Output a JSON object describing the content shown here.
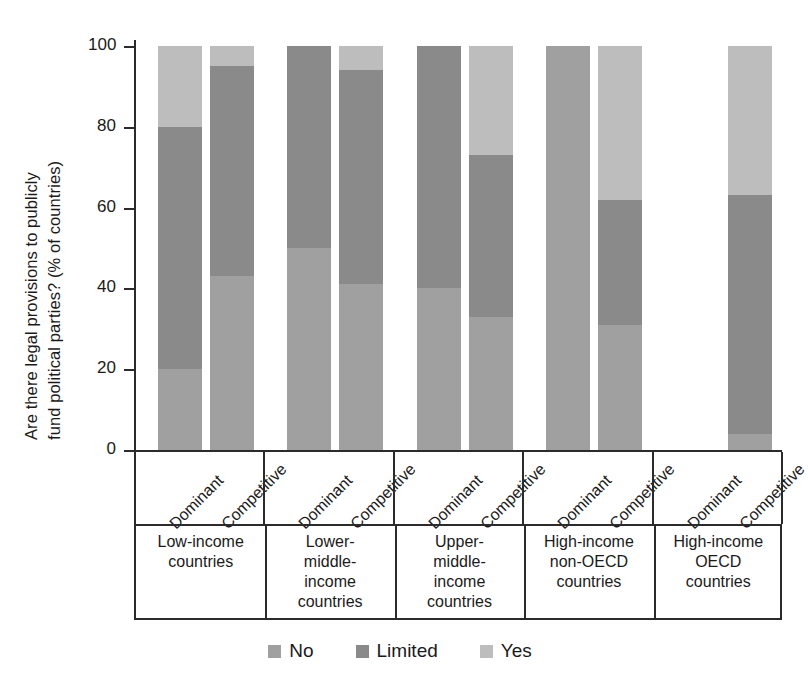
{
  "chart_data": {
    "type": "bar",
    "stacked": true,
    "orientation": "vertical",
    "title": "",
    "ylabel": "Are there legal provisions to publicly fund political parties? (% of countries)",
    "ylabel_line1": "Are there legal provisions to publicly",
    "ylabel_line2": "fund political parties? (% of countries)",
    "xlabel": "",
    "ylim": [
      0,
      100
    ],
    "yticks": [
      0,
      20,
      40,
      60,
      80,
      100
    ],
    "ytick_labels": [
      "0",
      "20",
      "40",
      "60",
      "80",
      "100"
    ],
    "grid": false,
    "legend_position": "bottom",
    "series": [
      {
        "name": "No",
        "color": "#a0a0a0",
        "values": [
          20,
          43,
          50,
          41,
          40,
          33,
          100,
          31,
          0,
          4
        ]
      },
      {
        "name": "Limited",
        "color": "#8a8a8a",
        "values": [
          60,
          52,
          50,
          53,
          60,
          40,
          0,
          31,
          0,
          59
        ]
      },
      {
        "name": "Yes",
        "color": "#bdbdbd",
        "values": [
          20,
          5,
          0,
          6,
          0,
          27,
          0,
          38,
          0,
          37
        ]
      }
    ],
    "categories": [
      "Dominant",
      "Competitive",
      "Dominant",
      "Competitive",
      "Dominant",
      "Competitive",
      "Dominant",
      "Competitive",
      "Dominant",
      "Competitive"
    ],
    "groups": [
      {
        "label": "Low-income countries",
        "lines": [
          "Low-income",
          "countries"
        ]
      },
      {
        "label": "Lower-middle-income countries",
        "lines": [
          "Lower-",
          "middle-",
          "income",
          "countries"
        ]
      },
      {
        "label": "Upper-middle-income countries",
        "lines": [
          "Upper-",
          "middle-",
          "income",
          "countries"
        ]
      },
      {
        "label": "High-income non-OECD countries",
        "lines": [
          "High-income",
          "non-OECD",
          "countries"
        ]
      },
      {
        "label": "High-income OECD countries",
        "lines": [
          "High-income",
          "OECD",
          "countries"
        ]
      }
    ]
  },
  "legend": {
    "items": [
      {
        "label": "No",
        "color": "#a0a0a0"
      },
      {
        "label": "Limited",
        "color": "#8a8a8a"
      },
      {
        "label": "Yes",
        "color": "#bdbdbd"
      }
    ]
  }
}
